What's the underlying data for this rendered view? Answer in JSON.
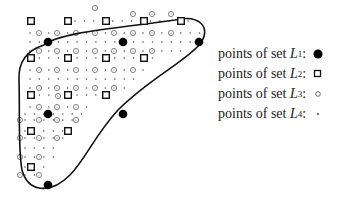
{
  "figure": {
    "grid": {
      "x0": 31,
      "y0": 21,
      "dx": 9.42,
      "dy": 9.27
    },
    "curve_path": "M 44 45 C 60 32, 120 28, 175 20 C 200 14, 212 28, 200 44 C 185 62, 150 78, 118 110 C 95 135, 85 160, 70 175 C 50 195, 28 192, 22 170 C 18 150, 20 110, 19 80 C 18 60, 28 50, 44 45 Z",
    "set_L1": [
      [
        48,
        42
      ],
      [
        123,
        42
      ],
      [
        199,
        42
      ],
      [
        48,
        114
      ],
      [
        123,
        114
      ],
      [
        48,
        185
      ]
    ],
    "set_L2": [
      [
        31,
        21
      ],
      [
        68,
        21
      ],
      [
        106,
        21
      ],
      [
        144,
        21
      ],
      [
        181,
        21
      ],
      [
        31,
        58
      ],
      [
        68,
        58
      ],
      [
        106,
        58
      ],
      [
        144,
        58
      ],
      [
        31,
        95
      ],
      [
        68,
        95
      ],
      [
        106,
        95
      ],
      [
        31,
        131
      ],
      [
        68,
        131
      ],
      [
        31,
        167
      ]
    ],
    "set_L3": [
      [
        95,
        8
      ],
      [
        39,
        33
      ],
      [
        57,
        33
      ],
      [
        76,
        33
      ],
      [
        95,
        33
      ],
      [
        114,
        33
      ],
      [
        133,
        33
      ],
      [
        152,
        33
      ],
      [
        171,
        33
      ],
      [
        133,
        14
      ],
      [
        152,
        14
      ],
      [
        171,
        14
      ],
      [
        39,
        51
      ],
      [
        57,
        51
      ],
      [
        76,
        51
      ],
      [
        95,
        51
      ],
      [
        114,
        51
      ],
      [
        133,
        51
      ],
      [
        152,
        51
      ],
      [
        39,
        70
      ],
      [
        57,
        70
      ],
      [
        76,
        70
      ],
      [
        95,
        70
      ],
      [
        114,
        70
      ],
      [
        133,
        70
      ],
      [
        39,
        88
      ],
      [
        57,
        88
      ],
      [
        76,
        88
      ],
      [
        95,
        88
      ],
      [
        114,
        88
      ],
      [
        39,
        107
      ],
      [
        57,
        107
      ],
      [
        76,
        107
      ],
      [
        20,
        120
      ],
      [
        39,
        120
      ],
      [
        57,
        120
      ],
      [
        20,
        138
      ],
      [
        39,
        138
      ],
      [
        57,
        138
      ],
      [
        76,
        120
      ],
      [
        20,
        157
      ],
      [
        39,
        157
      ],
      [
        20,
        175
      ],
      [
        39,
        175
      ],
      [
        58,
        96
      ]
    ],
    "set_L4_rows": [
      {
        "y": 21,
        "x_from": 75,
        "x_to": 200
      },
      {
        "y": 33,
        "x_from": 30,
        "x_to": 200
      },
      {
        "y": 42,
        "x_from": 30,
        "x_to": 200
      },
      {
        "y": 51,
        "x_from": 30,
        "x_to": 185
      },
      {
        "y": 58,
        "x_from": 30,
        "x_to": 160
      },
      {
        "y": 70,
        "x_from": 30,
        "x_to": 150
      },
      {
        "y": 79,
        "x_from": 30,
        "x_to": 135
      },
      {
        "y": 88,
        "x_from": 30,
        "x_to": 125
      },
      {
        "y": 95,
        "x_from": 30,
        "x_to": 100
      },
      {
        "y": 107,
        "x_from": 30,
        "x_to": 95
      },
      {
        "y": 114,
        "x_from": 25,
        "x_to": 85
      },
      {
        "y": 120,
        "x_from": 25,
        "x_to": 80
      },
      {
        "y": 131,
        "x_from": 25,
        "x_to": 70
      },
      {
        "y": 138,
        "x_from": 25,
        "x_to": 65
      },
      {
        "y": 148,
        "x_from": 25,
        "x_to": 60
      },
      {
        "y": 157,
        "x_from": 25,
        "x_to": 55
      },
      {
        "y": 167,
        "x_from": 25,
        "x_to": 45
      },
      {
        "y": 175,
        "x_from": 25,
        "x_to": 40
      }
    ]
  },
  "legend": {
    "items": [
      {
        "prefix": "points of set ",
        "var": "L",
        "sub": "1",
        "suffix": ":",
        "symbol": "filled-disc"
      },
      {
        "prefix": "points of set ",
        "var": "L",
        "sub": "2",
        "suffix": ":",
        "symbol": "open-square"
      },
      {
        "prefix": "points of set ",
        "var": "L",
        "sub": "3",
        "suffix": ":",
        "symbol": "open-circle"
      },
      {
        "prefix": "points of set ",
        "var": "L",
        "sub": "4",
        "suffix": ":",
        "symbol": "dot"
      }
    ]
  }
}
